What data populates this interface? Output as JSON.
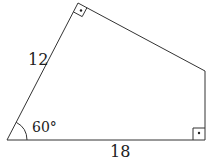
{
  "figure": {
    "type": "quadrilateral",
    "side_labels": {
      "left_side": "12",
      "bottom_side": "18"
    },
    "angle_label": "60°",
    "right_angle_markers": [
      "top-vertex",
      "bottom-right-vertex"
    ],
    "stroke_color": "#333333",
    "background": "#ffffff"
  }
}
